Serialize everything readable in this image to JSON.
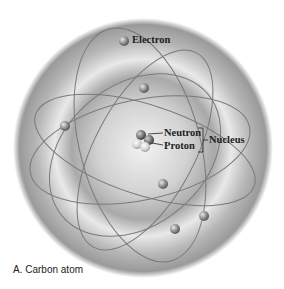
{
  "diagram": {
    "subject": "Carbon atom",
    "labels": {
      "electron": "Electron",
      "neutron": "Neutron",
      "proton": "Proton",
      "nucleus": "Nucleus"
    },
    "caption": "A. Carbon atom",
    "electron_count": 6,
    "colors": {
      "cloud_outer": "#9a9a9a",
      "cloud_inner": "#e4e4e4",
      "orbit": "#7a7a7a",
      "electron": "#8c8c8c",
      "text": "#222222"
    }
  }
}
